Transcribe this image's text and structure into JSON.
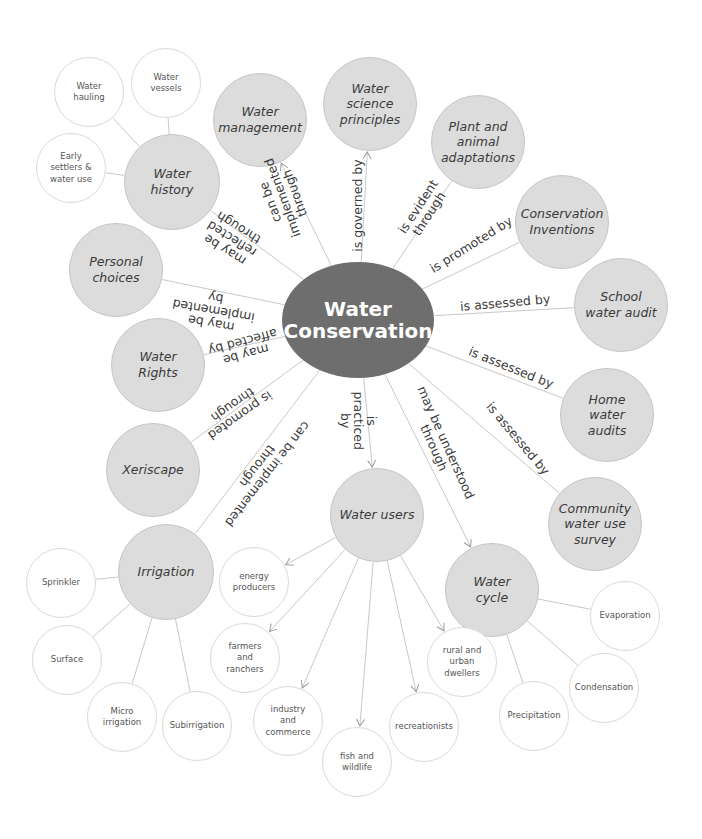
{
  "title": "Water Conservation",
  "center": {
    "label": "Water\nConservation",
    "x": 358,
    "y": 320,
    "rx": 76,
    "ry": 58,
    "color": "#6e6e6e"
  },
  "colors": {
    "primary_fill": "#dcdcdc",
    "leaf_fill": "#ffffff",
    "line": "#c8c8c8",
    "center_fill": "#6e6e6e"
  },
  "primary_nodes": [
    {
      "id": "water_history",
      "label": "Water\nhistory",
      "x": 172,
      "y": 182,
      "r": 48
    },
    {
      "id": "water_management",
      "label": "Water\nmanagement",
      "x": 260,
      "y": 120,
      "r": 47
    },
    {
      "id": "water_science",
      "label": "Water\nscience\nprinciples",
      "x": 370,
      "y": 104,
      "r": 47
    },
    {
      "id": "plant_animal",
      "label": "Plant and\nanimal\nadaptations",
      "x": 478,
      "y": 142,
      "r": 47
    },
    {
      "id": "conservation_inventions",
      "label": "Conservation\nInventions",
      "x": 562,
      "y": 222,
      "r": 47
    },
    {
      "id": "school_audit",
      "label": "School\nwater audit",
      "x": 621,
      "y": 305,
      "r": 47
    },
    {
      "id": "home_audits",
      "label": "Home\nwater\naudits",
      "x": 607,
      "y": 415,
      "r": 47
    },
    {
      "id": "community_survey",
      "label": "Community\nwater use\nsurvey",
      "x": 595,
      "y": 524,
      "r": 47
    },
    {
      "id": "personal_choices",
      "label": "Personal\nchoices",
      "x": 116,
      "y": 270,
      "r": 47
    },
    {
      "id": "water_rights",
      "label": "Water\nRights",
      "x": 158,
      "y": 365,
      "r": 47
    },
    {
      "id": "xeriscape",
      "label": "Xeriscape",
      "x": 153,
      "y": 470,
      "r": 47
    },
    {
      "id": "irrigation",
      "label": "Irrigation",
      "x": 166,
      "y": 572,
      "r": 48
    },
    {
      "id": "water_users",
      "label": "Water users",
      "x": 377,
      "y": 515,
      "r": 47
    },
    {
      "id": "water_cycle",
      "label": "Water\ncycle",
      "x": 492,
      "y": 590,
      "r": 47
    }
  ],
  "leaf_nodes": [
    {
      "id": "water_hauling",
      "parent": "water_history",
      "label": "Water\nhauling",
      "x": 89,
      "y": 92,
      "r": 35,
      "arrow": false
    },
    {
      "id": "water_vessels",
      "parent": "water_history",
      "label": "Water\nvessels",
      "x": 166,
      "y": 83,
      "r": 35,
      "arrow": false
    },
    {
      "id": "early_settlers",
      "parent": "water_history",
      "label": "Early\nsettlers &\nwater use",
      "x": 71,
      "y": 168,
      "r": 35,
      "arrow": false
    },
    {
      "id": "sprinkler",
      "parent": "irrigation",
      "label": "Sprinkler",
      "x": 61,
      "y": 583,
      "r": 35,
      "arrow": false
    },
    {
      "id": "surface",
      "parent": "irrigation",
      "label": "Surface",
      "x": 67,
      "y": 660,
      "r": 35,
      "arrow": false
    },
    {
      "id": "micro_irrigation",
      "parent": "irrigation",
      "label": "Micro\nirrigation",
      "x": 122,
      "y": 717,
      "r": 35,
      "arrow": false
    },
    {
      "id": "subirrigation",
      "parent": "irrigation",
      "label": "Subirrigation",
      "x": 197,
      "y": 726,
      "r": 35,
      "arrow": false
    },
    {
      "id": "energy_producers",
      "parent": "water_users",
      "label": "energy\nproducers",
      "x": 254,
      "y": 582,
      "r": 35,
      "arrow": true
    },
    {
      "id": "farmers_ranchers",
      "parent": "water_users",
      "label": "farmers\nand\nranchers",
      "x": 245,
      "y": 658,
      "r": 35,
      "arrow": true
    },
    {
      "id": "industry_commerce",
      "parent": "water_users",
      "label": "industry\nand\ncommerce",
      "x": 288,
      "y": 721,
      "r": 35,
      "arrow": true
    },
    {
      "id": "fish_wildlife",
      "parent": "water_users",
      "label": "fish and\nwildlife",
      "x": 357,
      "y": 762,
      "r": 35,
      "arrow": true
    },
    {
      "id": "recreationists",
      "parent": "water_users",
      "label": "recreationists",
      "x": 424,
      "y": 727,
      "r": 35,
      "arrow": true
    },
    {
      "id": "rural_urban",
      "parent": "water_users",
      "label": "rural and\nurban\ndwellers",
      "x": 462,
      "y": 662,
      "r": 35,
      "arrow": true
    },
    {
      "id": "evaporation",
      "parent": "water_cycle",
      "label": "Evaporation",
      "x": 625,
      "y": 616,
      "r": 35,
      "arrow": false
    },
    {
      "id": "condensation",
      "parent": "water_cycle",
      "label": "Condensation",
      "x": 604,
      "y": 688,
      "r": 35,
      "arrow": false
    },
    {
      "id": "precipitation",
      "parent": "water_cycle",
      "label": "Precipitation",
      "x": 534,
      "y": 716,
      "r": 35,
      "arrow": false
    }
  ],
  "links": [
    {
      "to": "water_history",
      "label": "may be\nreflected\nthrough",
      "lx": 232,
      "ly": 238,
      "angle": 212,
      "arrow": false
    },
    {
      "to": "water_management",
      "label": "can be\nimplemented\nthrough",
      "lx": 282,
      "ly": 197,
      "angle": 250,
      "arrow": true
    },
    {
      "to": "water_science",
      "label": "is governed by",
      "lx": 357,
      "ly": 205,
      "angle": -90,
      "arrow": true
    },
    {
      "to": "plant_animal",
      "label": "is evident\nthrough",
      "lx": 423,
      "ly": 210,
      "angle": -57,
      "arrow": false
    },
    {
      "to": "conservation_inventions",
      "label": "is promoted by",
      "lx": 471,
      "ly": 244,
      "angle": -32,
      "arrow": false
    },
    {
      "to": "school_audit",
      "label": "is assessed by",
      "lx": 505,
      "ly": 302,
      "angle": -5,
      "arrow": false
    },
    {
      "to": "home_audits",
      "label": "is assessed by",
      "lx": 511,
      "ly": 367,
      "angle": 22,
      "arrow": false
    },
    {
      "to": "community_survey",
      "label": "is assessed by",
      "lx": 518,
      "ly": 438,
      "angle": 50,
      "arrow": false
    },
    {
      "to": "personal_choices",
      "label": "may be\nimplemented\nby",
      "lx": 213,
      "ly": 310,
      "angle": 190,
      "arrow": false
    },
    {
      "to": "water_rights",
      "label": "may be\naffected by",
      "lx": 244,
      "ly": 348,
      "angle": 165,
      "arrow": false
    },
    {
      "to": "xeriscape",
      "label": "is promoted\nthrough",
      "lx": 236,
      "ly": 410,
      "angle": 145,
      "arrow": false
    },
    {
      "to": "irrigation",
      "label": "can be implemented\nthrough",
      "lx": 262,
      "ly": 470,
      "angle": 128,
      "arrow": false
    },
    {
      "to": "water_users",
      "label": "is\npracticed\nby",
      "lx": 358,
      "ly": 420,
      "angle": 90,
      "arrow": true
    },
    {
      "to": "water_cycle",
      "label": "may be understood\nthrough",
      "lx": 440,
      "ly": 445,
      "angle": 66,
      "arrow": true
    }
  ]
}
